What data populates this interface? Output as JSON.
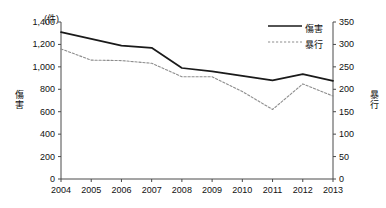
{
  "chart_data": {
    "type": "line",
    "title": "",
    "unit_note": "(件)",
    "xlabel": "",
    "categories": [
      "2004",
      "2005",
      "2006",
      "2007",
      "2008",
      "2009",
      "2010",
      "2011",
      "2012",
      "2013"
    ],
    "grid": false,
    "legend_position": "top-right",
    "axes": {
      "left": {
        "label": "傷害",
        "ylim": [
          0,
          1400
        ],
        "ticks": [
          0,
          200,
          400,
          600,
          800,
          1000,
          1200,
          1400
        ],
        "tick_labels": [
          "0",
          "200",
          "400",
          "600",
          "800",
          "1,000",
          "1,200",
          "1,400"
        ]
      },
      "right": {
        "label": "暴行",
        "ylim": [
          0,
          350
        ],
        "ticks": [
          0,
          50,
          100,
          150,
          200,
          250,
          300,
          350
        ],
        "tick_labels": [
          "0",
          "50",
          "100",
          "150",
          "200",
          "250",
          "300",
          "350"
        ]
      }
    },
    "series": [
      {
        "name": "傷害",
        "axis": "left",
        "style": "solid",
        "color": "#1a1a1a",
        "values": [
          1310,
          1250,
          1190,
          1170,
          990,
          960,
          920,
          880,
          935,
          875
        ]
      },
      {
        "name": "暴行",
        "axis": "right",
        "style": "dashed",
        "color": "#8d8d8d",
        "values": [
          290,
          265,
          264,
          258,
          228,
          228,
          195,
          155,
          212,
          185
        ]
      }
    ]
  },
  "legend": {
    "items": [
      {
        "label": "傷害",
        "style": "solid"
      },
      {
        "label": "暴行",
        "style": "dashed"
      }
    ]
  },
  "colors": {
    "series_solid": "#1a1a1a",
    "series_dashed": "#8d8d8d",
    "axis": "#4a4a4a",
    "text": "#111111",
    "background": "#ffffff"
  }
}
